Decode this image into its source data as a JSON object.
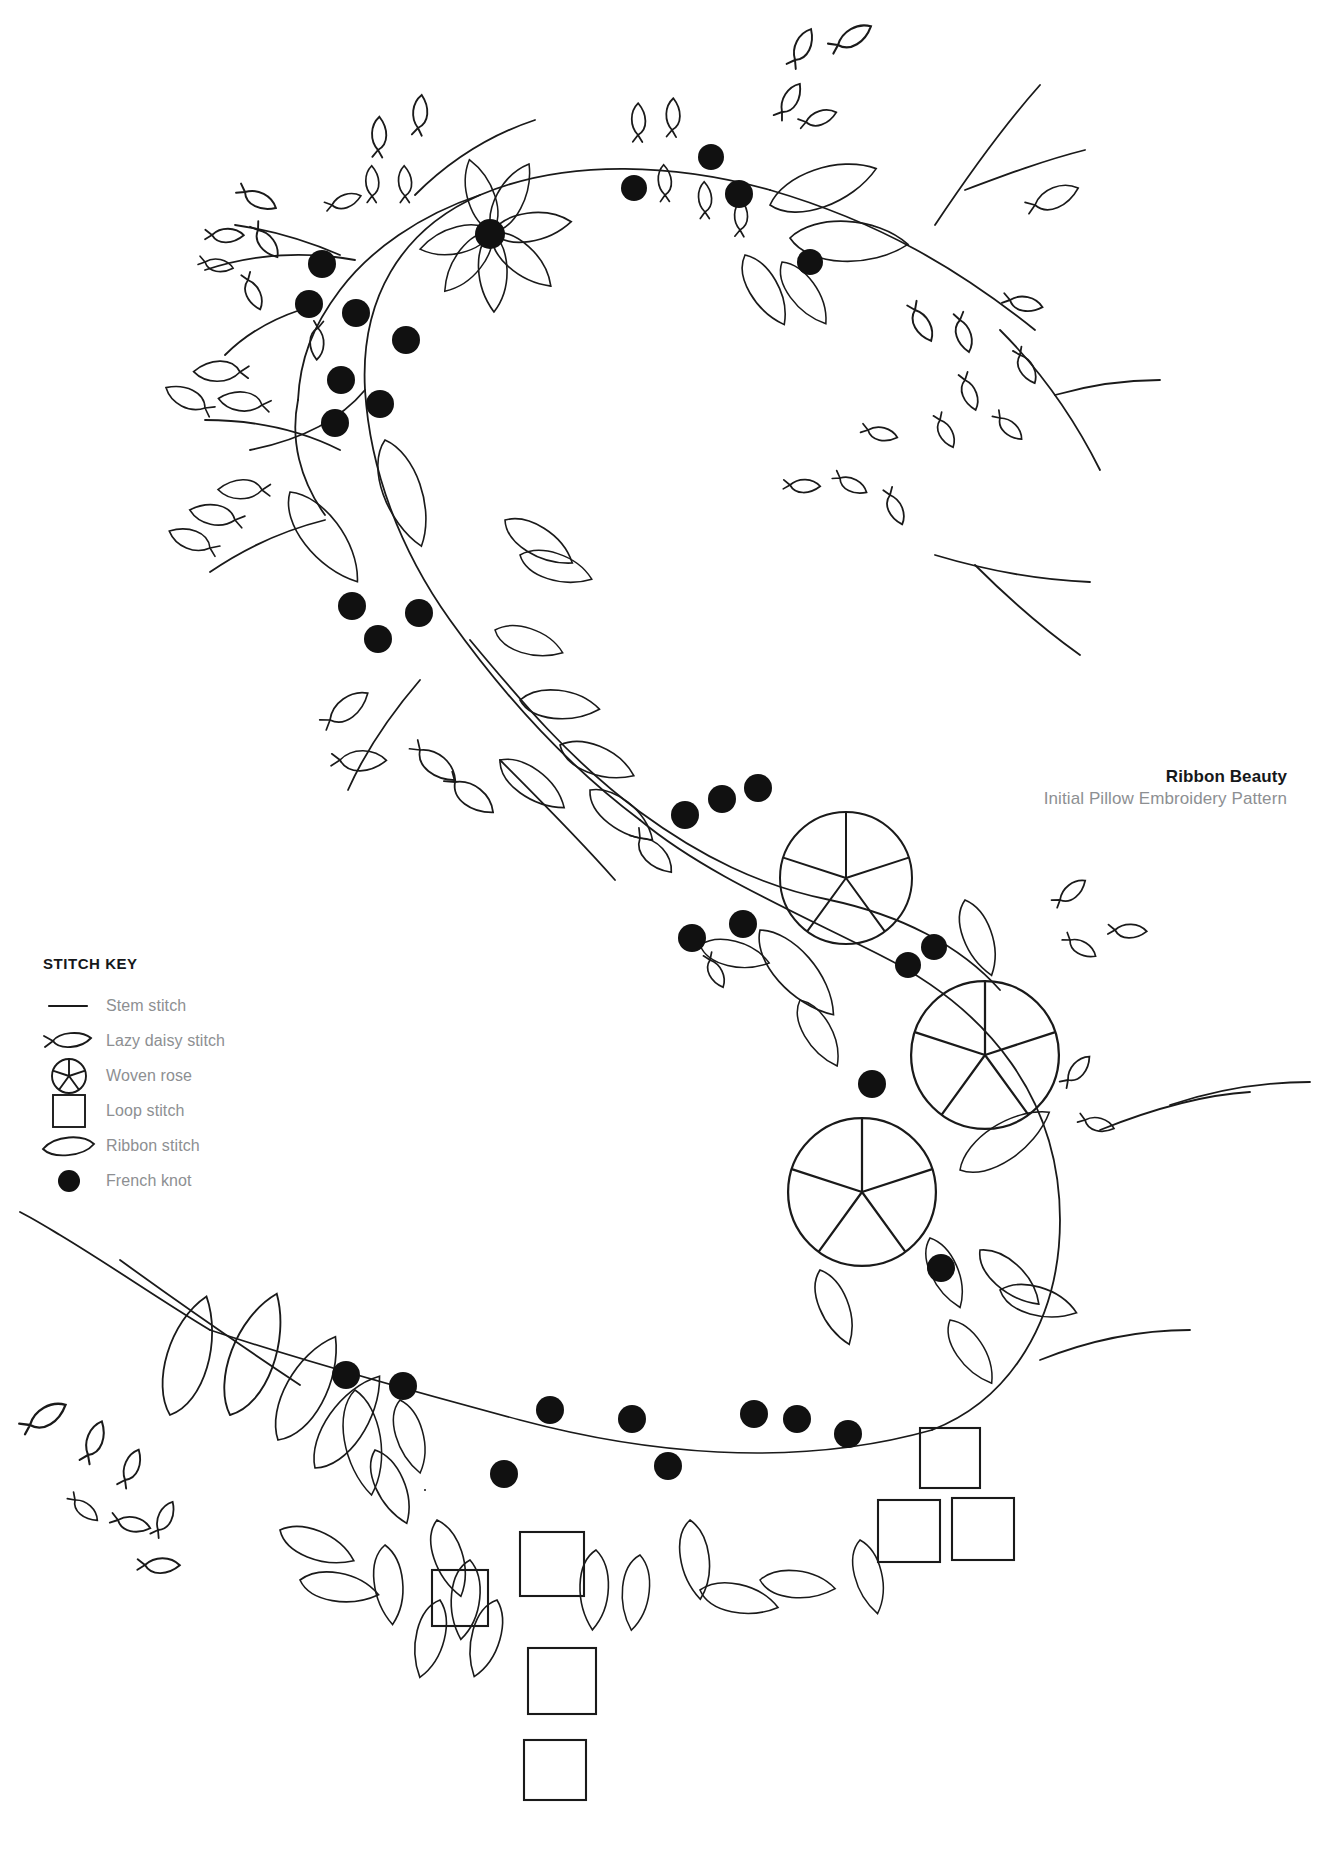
{
  "document": {
    "kind": "embroidery-pattern-sheet",
    "background_color": "#ffffff",
    "ink_color": "#1a1a1a",
    "muted_text_color": "#8d8f92"
  },
  "title_block": {
    "title": "Ribbon Beauty",
    "subtitle": "Initial Pillow Embroidery Pattern"
  },
  "stitch_key": {
    "heading": "STITCH KEY",
    "items": [
      {
        "icon": "stem-stitch-icon",
        "label": "Stem stitch"
      },
      {
        "icon": "lazy-daisy-icon",
        "label": "Lazy daisy stitch"
      },
      {
        "icon": "woven-rose-icon",
        "label": "Woven rose"
      },
      {
        "icon": "loop-stitch-icon",
        "label": "Loop stitch"
      },
      {
        "icon": "ribbon-stitch-icon",
        "label": "Ribbon stitch"
      },
      {
        "icon": "french-knot-icon",
        "label": "French knot"
      }
    ]
  },
  "motif": {
    "letter": "C",
    "description": "Hand drawn floral letter C monogram made of a curving stem with leaves, berries, knots, woven roses and loop squares",
    "element_counts": {
      "woven_roses": 3,
      "loop_squares": 8,
      "french_knots": 38
    }
  }
}
